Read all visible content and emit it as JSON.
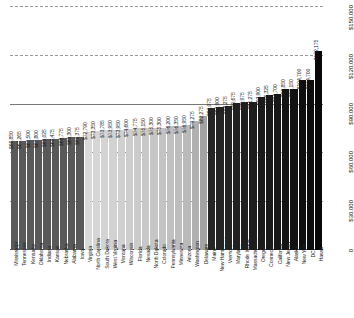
{
  "chart_data": {
    "type": "bar",
    "title": "",
    "subtitle": "",
    "xlabel": "",
    "ylabel": "",
    "orientation": "vertical",
    "grid": true,
    "legend": false,
    "axis_ticks": [
      "0",
      "$30,000",
      "$60,000",
      "$90,000",
      "$120,000",
      "$150,000"
    ],
    "axis_tick_values": [
      0,
      30000,
      60000,
      90000,
      120000,
      150000
    ],
    "ylim": [
      0,
      150000
    ],
    "value_prefix": "$",
    "categories": [
      "Mississippi",
      "Tennessee",
      "Kentucky",
      "Oklahoma",
      "Indiana",
      "Kansas",
      "Nebraska",
      "Alabama",
      "Iowa",
      "Virginia",
      "North Carolina",
      "South Dakota",
      "West Virginia",
      "Montana",
      "Wisconsin",
      "Florida",
      "Nevada",
      "North Dakota",
      "Colorado",
      "Pennsylvania",
      "Minnesota",
      "Arizona",
      "Washington",
      "Delaware",
      "Maine",
      "New Hampshire",
      "Vermont",
      "Maryland",
      "Rhode Island",
      "Massachusetts",
      "Oregon",
      "Connecticut",
      "California",
      "New Jersey",
      "Alaska",
      "New York",
      "DC",
      "Hawaii"
    ],
    "values": [
      66850,
      67265,
      67500,
      67800,
      68025,
      68475,
      68775,
      69300,
      69375,
      72790,
      73350,
      73785,
      73950,
      73950,
      74600,
      74775,
      75150,
      75300,
      75300,
      76200,
      76350,
      76950,
      79275,
      82275,
      87075,
      87900,
      88275,
      90675,
      90975,
      91275,
      93900,
      95325,
      95700,
      98850,
      99150,
      104700,
      104700,
      122175
    ],
    "value_labels": [
      "$66,850",
      "$67,265",
      "$67,500",
      "$67,800",
      "$68,025",
      "$68,475",
      "$68,775",
      "$69,300",
      "$69,375",
      "$72,790",
      "$73,350",
      "$73,785",
      "$73,950",
      "$73,950",
      "$74,600",
      "$74,775",
      "$75,150",
      "$75,300",
      "$75,300",
      "$76,200",
      "$76,350",
      "$76,950",
      "$79,275",
      "$82,275",
      "$87,075",
      "$87,900",
      "$88,275",
      "$90,675",
      "$90,975",
      "$91,275",
      "$93,900",
      "$95,325",
      "$95,700",
      "$98,850",
      "$99,150",
      "$104,700",
      "$104,700",
      "$122,175"
    ],
    "bar_colors": [
      "#595959",
      "#595959",
      "#595959",
      "#595959",
      "#595959",
      "#595959",
      "#595959",
      "#595959",
      "#595959",
      "#d9d9d9",
      "#d6d6d6",
      "#d4d4d4",
      "#d2d2d2",
      "#d0d0d0",
      "#cdcdcd",
      "#cbcbcb",
      "#c8c8c8",
      "#c6c6c6",
      "#c3c3c3",
      "#c0c0c0",
      "#bdbdbd",
      "#bababa",
      "#b0b0b0",
      "#a3a3a3",
      "#262626",
      "#242424",
      "#232323",
      "#212121",
      "#1f1f1f",
      "#1d1d1d",
      "#1b1b1b",
      "#191919",
      "#171717",
      "#141414",
      "#121212",
      "#0f0f0f",
      "#0c0c0c",
      "#080808"
    ]
  }
}
